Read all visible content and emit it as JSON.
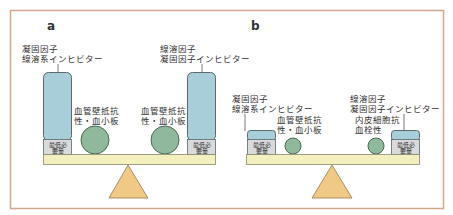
{
  "colors": {
    "frame": "#d4a88c",
    "column_fill": "#a8cfd9",
    "column_stroke": "#5a6a6e",
    "min_box_fill": "#d9dadc",
    "circle_fill": "#8fb89c",
    "circle_stroke": "#4b6b55",
    "beam_fill": "#f4efbf",
    "beam_stroke": "#8a8a6a",
    "fulcrum_fill": "#f0c987",
    "fulcrum_stroke": "#9a7a4a",
    "text": "#333333"
  },
  "panels": [
    {
      "id": "a",
      "label": "a",
      "left_column": {
        "label_line1": "凝固因子",
        "label_line2": "線溶系インヒビター",
        "min_label_line1": "最低必",
        "min_label_line2": "要量"
      },
      "left_circle": {
        "label_line1": "血管壁抵抗",
        "label_line2": "性・血小板"
      },
      "right_circle": {
        "label_line1": "血管壁抵抗",
        "label_line2": "性・血小板"
      },
      "right_column": {
        "label_line1": "線溶因子",
        "label_line2": "凝固因子インヒビター",
        "min_label_line1": "最低必",
        "min_label_line2": "要量"
      }
    },
    {
      "id": "b",
      "label": "b",
      "left_column": {
        "label_line1": "凝固因子",
        "label_line2": "線溶系インヒビター",
        "min_label_line1": "最低必",
        "min_label_line2": "要量"
      },
      "left_circle": {
        "label_line1": "血管壁抵抗",
        "label_line2": "性・血小板"
      },
      "right_circle": {
        "label_line1": "内皮細胞抗",
        "label_line2": "血栓性"
      },
      "right_column": {
        "label_line1": "線溶因子",
        "label_line2": "凝固因子インヒビター",
        "min_label_line1": "最低必",
        "min_label_line2": "要量"
      }
    }
  ]
}
